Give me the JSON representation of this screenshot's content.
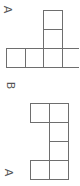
{
  "figures": [
    {
      "label": "A",
      "cells": [
        {
          "x": 43,
          "y": 10
        },
        {
          "x": 43,
          "y": 29
        },
        {
          "x": 6,
          "y": 48
        },
        {
          "x": 24.5,
          "y": 48
        },
        {
          "x": 43,
          "y": 48
        },
        {
          "x": 61.5,
          "y": 48
        }
      ]
    },
    {
      "label": "B",
      "cells": []
    },
    {
      "label": "A",
      "cells": [
        {
          "x": 30,
          "y": 103
        },
        {
          "x": 49,
          "y": 103
        },
        {
          "x": 49,
          "y": 122
        },
        {
          "x": 49,
          "y": 141
        },
        {
          "x": 30,
          "y": 160
        },
        {
          "x": 49,
          "y": 160
        }
      ]
    }
  ],
  "cell_size": 19,
  "line_color": "#6e6e6e"
}
